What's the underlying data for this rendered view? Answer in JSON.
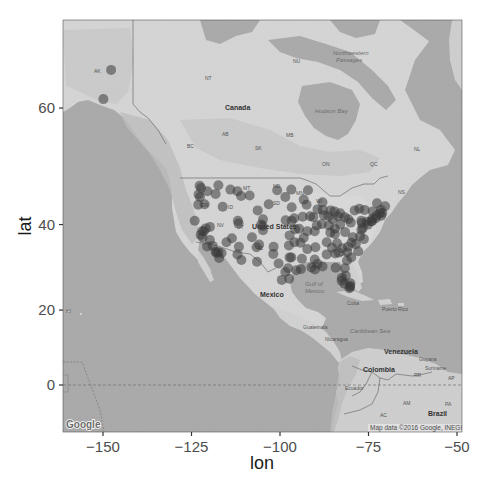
{
  "figure": {
    "basemap": "Google terrain map (grayscale)",
    "attribution": "Map data ©2016 Google, INEGI",
    "logo": "Google"
  },
  "map_labels": {
    "countries": [
      "Canada",
      "United States",
      "Mexico",
      "Cuba",
      "Puerto Rico",
      "Guatemala",
      "Nicaragua",
      "Venezuela",
      "Colombia",
      "Ecuador",
      "Guyana",
      "Suriname",
      "Brazil"
    ],
    "regions": [
      "AK",
      "NT",
      "NU",
      "BC",
      "AB",
      "SK",
      "MB",
      "ON",
      "QC",
      "NL",
      "ND",
      "MT",
      "SD",
      "OR",
      "ID",
      "NV",
      "UT",
      "WI",
      "MN",
      "GA",
      "LA",
      "AZ",
      "NS",
      "HI",
      "RR",
      "AP",
      "AM",
      "PA",
      "AC"
    ],
    "water": [
      "Northwestern Passages",
      "Hudson Bay",
      "Gulf of Mexico",
      "Caribbean Sea"
    ]
  },
  "chart_data": {
    "type": "scatter",
    "title": "",
    "xlabel": "lon",
    "ylabel": "lat",
    "xlim": [
      -161.3,
      -48.6
    ],
    "ylim": [
      -12.6,
      72.6
    ],
    "x_ticks": [
      -150,
      -125,
      -100,
      -75,
      -50
    ],
    "x_tick_labels": [
      "−150",
      "−125",
      "−100",
      "−75",
      "−50"
    ],
    "y_ticks": [
      0,
      20,
      40,
      60
    ],
    "y_tick_labels": [
      "0",
      "20",
      "40",
      "60"
    ],
    "grid": false,
    "legend": null,
    "point_color": "#3a3a3a",
    "point_alpha": 0.55,
    "series": [
      {
        "name": "locations",
        "points": [
          [
            -147.7,
            64.8
          ],
          [
            -149.9,
            61.2
          ],
          [
            -122.7,
            47.6
          ],
          [
            -122.3,
            47.2
          ],
          [
            -123.0,
            46.0
          ],
          [
            -122.6,
            45.5
          ],
          [
            -123.1,
            44.0
          ],
          [
            -121.3,
            44.1
          ],
          [
            -117.4,
            47.7
          ],
          [
            -116.2,
            43.6
          ],
          [
            -120.5,
            46.6
          ],
          [
            -118.2,
            46.1
          ],
          [
            -124.1,
            40.8
          ],
          [
            -122.4,
            37.8
          ],
          [
            -121.9,
            37.3
          ],
          [
            -122.0,
            38.6
          ],
          [
            -121.5,
            38.6
          ],
          [
            -120.6,
            35.3
          ],
          [
            -119.8,
            36.7
          ],
          [
            -119.0,
            35.4
          ],
          [
            -118.2,
            34.1
          ],
          [
            -117.9,
            33.8
          ],
          [
            -117.2,
            32.7
          ],
          [
            -117.4,
            34.1
          ],
          [
            -116.5,
            33.8
          ],
          [
            -115.1,
            36.2
          ],
          [
            -119.8,
            39.5
          ],
          [
            -121.0,
            39.2
          ],
          [
            -111.9,
            40.8
          ],
          [
            -111.7,
            40.2
          ],
          [
            -112.0,
            33.5
          ],
          [
            -110.9,
            32.2
          ],
          [
            -111.6,
            35.2
          ],
          [
            -106.6,
            35.1
          ],
          [
            -106.5,
            31.8
          ],
          [
            -105.9,
            35.7
          ],
          [
            -104.9,
            39.7
          ],
          [
            -105.3,
            40.0
          ],
          [
            -104.8,
            38.8
          ],
          [
            -108.6,
            45.8
          ],
          [
            -111.0,
            45.7
          ],
          [
            -114.0,
            46.9
          ],
          [
            -112.0,
            46.6
          ],
          [
            -106.3,
            42.9
          ],
          [
            -104.8,
            41.1
          ],
          [
            -107.9,
            37.3
          ],
          [
            -113.6,
            37.1
          ],
          [
            -100.8,
            46.8
          ],
          [
            -96.8,
            46.9
          ],
          [
            -98.5,
            45.5
          ],
          [
            -96.7,
            43.5
          ],
          [
            -103.2,
            44.1
          ],
          [
            -96.0,
            41.3
          ],
          [
            -96.7,
            40.8
          ],
          [
            -98.4,
            40.9
          ],
          [
            -97.3,
            37.7
          ],
          [
            -95.7,
            39.0
          ],
          [
            -94.6,
            39.1
          ],
          [
            -97.5,
            35.5
          ],
          [
            -95.9,
            36.2
          ],
          [
            -101.8,
            35.2
          ],
          [
            -101.9,
            33.6
          ],
          [
            -97.3,
            32.8
          ],
          [
            -96.8,
            32.8
          ],
          [
            -97.7,
            30.3
          ],
          [
            -98.5,
            29.4
          ],
          [
            -95.4,
            29.8
          ],
          [
            -94.1,
            30.1
          ],
          [
            -97.4,
            27.8
          ],
          [
            -99.5,
            27.5
          ],
          [
            -100.4,
            31.4
          ],
          [
            -93.3,
            45.0
          ],
          [
            -92.1,
            46.8
          ],
          [
            -92.5,
            44.0
          ],
          [
            -93.6,
            41.6
          ],
          [
            -91.5,
            41.7
          ],
          [
            -90.6,
            41.5
          ],
          [
            -89.4,
            43.1
          ],
          [
            -87.9,
            43.0
          ],
          [
            -88.0,
            44.5
          ],
          [
            -87.6,
            41.9
          ],
          [
            -88.2,
            40.1
          ],
          [
            -89.6,
            39.8
          ],
          [
            -90.2,
            38.6
          ],
          [
            -92.3,
            38.6
          ],
          [
            -93.3,
            37.2
          ],
          [
            -92.3,
            34.7
          ],
          [
            -94.2,
            36.1
          ],
          [
            -90.0,
            35.1
          ],
          [
            -86.8,
            36.2
          ],
          [
            -85.3,
            35.0
          ],
          [
            -83.9,
            36.0
          ],
          [
            -86.8,
            33.5
          ],
          [
            -88.0,
            30.7
          ],
          [
            -90.1,
            30.0
          ],
          [
            -91.1,
            30.5
          ],
          [
            -93.8,
            32.5
          ],
          [
            -90.2,
            32.3
          ],
          [
            -89.4,
            31.3
          ],
          [
            -86.2,
            39.8
          ],
          [
            -85.1,
            41.1
          ],
          [
            -86.3,
            41.7
          ],
          [
            -84.5,
            39.1
          ],
          [
            -83.0,
            40.0
          ],
          [
            -81.7,
            41.5
          ],
          [
            -83.6,
            41.7
          ],
          [
            -80.7,
            41.1
          ],
          [
            -84.6,
            42.7
          ],
          [
            -83.0,
            42.3
          ],
          [
            -85.7,
            42.9
          ],
          [
            -84.5,
            38.0
          ],
          [
            -85.8,
            38.3
          ],
          [
            -81.6,
            38.4
          ],
          [
            -80.0,
            40.4
          ],
          [
            -77.0,
            40.8
          ],
          [
            -76.9,
            40.3
          ],
          [
            -75.2,
            40.0
          ],
          [
            -75.5,
            40.6
          ],
          [
            -77.6,
            43.2
          ],
          [
            -78.9,
            42.9
          ],
          [
            -76.1,
            43.0
          ],
          [
            -73.8,
            42.7
          ],
          [
            -74.0,
            40.7
          ],
          [
            -73.9,
            41.2
          ],
          [
            -74.2,
            40.7
          ],
          [
            -72.9,
            41.3
          ],
          [
            -72.7,
            41.8
          ],
          [
            -71.4,
            41.8
          ],
          [
            -71.1,
            42.4
          ],
          [
            -71.8,
            42.3
          ],
          [
            -70.3,
            43.7
          ],
          [
            -71.5,
            43.0
          ],
          [
            -72.6,
            44.3
          ],
          [
            -77.0,
            38.9
          ],
          [
            -76.6,
            39.3
          ],
          [
            -77.4,
            37.5
          ],
          [
            -76.3,
            36.9
          ],
          [
            -79.4,
            37.3
          ],
          [
            -78.6,
            35.8
          ],
          [
            -80.8,
            35.2
          ],
          [
            -79.8,
            36.1
          ],
          [
            -77.9,
            34.2
          ],
          [
            -81.0,
            34.0
          ],
          [
            -79.9,
            32.8
          ],
          [
            -82.4,
            34.9
          ],
          [
            -84.4,
            33.7
          ],
          [
            -83.4,
            33.9
          ],
          [
            -81.1,
            32.1
          ],
          [
            -84.3,
            30.4
          ],
          [
            -81.7,
            30.3
          ],
          [
            -81.4,
            28.5
          ],
          [
            -82.5,
            28.0
          ],
          [
            -82.6,
            27.3
          ],
          [
            -80.2,
            26.1
          ],
          [
            -80.1,
            26.7
          ],
          [
            -81.8,
            26.6
          ],
          [
            -80.2,
            25.8
          ],
          [
            -80.4,
            25.5
          ]
        ]
      }
    ]
  }
}
